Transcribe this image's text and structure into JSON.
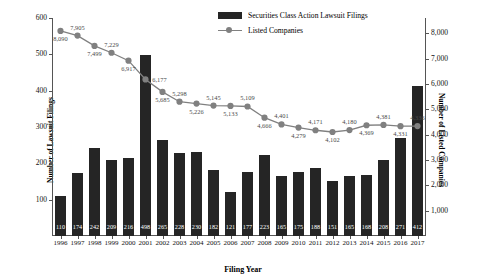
{
  "chart_data": {
    "type": "bar",
    "title": "",
    "xlabel": "Filing Year",
    "ylabel": "Number of Lawsuit Filings",
    "y2label": "Number of Listed Companies",
    "grid": false,
    "legend_position": "top-center",
    "ylim": [
      0,
      600
    ],
    "y2lim": [
      0,
      8600
    ],
    "yticks": [
      "100",
      "200",
      "300",
      "400",
      "500",
      "600"
    ],
    "ytick_values": [
      100,
      200,
      300,
      400,
      500,
      600
    ],
    "y2ticks": [
      "1,000",
      "2,000",
      "3,000",
      "4,000",
      "5,000",
      "6,000",
      "7,000",
      "8,000"
    ],
    "y2tick_values": [
      1000,
      2000,
      3000,
      4000,
      5000,
      6000,
      7000,
      8000
    ],
    "categories": [
      "1996",
      "1997",
      "1998",
      "1999",
      "2000",
      "2001",
      "2002",
      "2003",
      "2004",
      "2005",
      "2006",
      "2007",
      "2008",
      "2009",
      "2010",
      "2011",
      "2012",
      "2013",
      "2014",
      "2015",
      "2016",
      "2017"
    ],
    "series": [
      {
        "name": "Securities Class Action Lawsuit Filings",
        "type": "bar",
        "axis": "left",
        "color": "#252525",
        "values": [
          110,
          174,
          242,
          209,
          216,
          498,
          265,
          228,
          230,
          182,
          121,
          177,
          223,
          165,
          175,
          188,
          151,
          165,
          168,
          208,
          271,
          412
        ],
        "labels": [
          "110",
          "174",
          "242",
          "209",
          "216",
          "498",
          "265",
          "228",
          "230",
          "182",
          "121",
          "177",
          "223",
          "165",
          "175",
          "188",
          "151",
          "165",
          "168",
          "208",
          "271",
          "412"
        ]
      },
      {
        "name": "Listed Companies",
        "type": "line",
        "axis": "right",
        "color": "#808080",
        "values": [
          8090,
          7905,
          7499,
          7229,
          6917,
          6177,
          5685,
          5298,
          5226,
          5145,
          5133,
          5109,
          4666,
          4401,
          4279,
          4171,
          4102,
          4180,
          4369,
          4381,
          4331,
          4336
        ],
        "labels": [
          "8,090",
          "7,905",
          "7,499",
          "7,229",
          "6,917",
          "6,177",
          "5,685",
          "5,298",
          "5,226",
          "5,145",
          "5,133",
          "5,109",
          "4,666",
          "4,401",
          "4,279",
          "4,171",
          "4,102",
          "4,180",
          "4,369",
          "4,381",
          "4,331",
          "4,336"
        ],
        "label_positions": [
          "below",
          "above",
          "below",
          "above",
          "below",
          "right",
          "below",
          "above",
          "below",
          "above",
          "below",
          "above",
          "below",
          "above",
          "below",
          "above",
          "below",
          "above",
          "below",
          "above",
          "below",
          "above"
        ]
      }
    ]
  },
  "legend": {
    "items": [
      {
        "label": "Securities Class Action Lawsuit Filings",
        "marker": "bar-swatch"
      },
      {
        "label": "Listed Companies",
        "marker": "line-swatch"
      }
    ]
  }
}
